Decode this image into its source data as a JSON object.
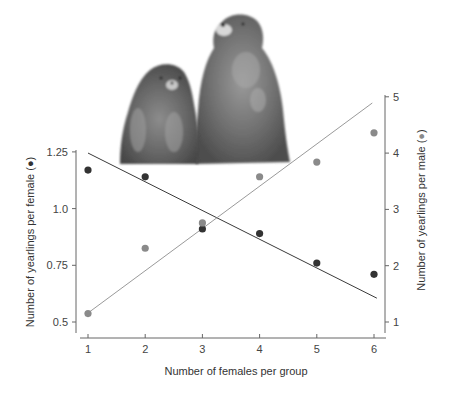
{
  "chart_data": {
    "type": "scatter",
    "title": "",
    "xlabel": "Number of females per group",
    "ylabel": "Number of yearlings per female (●)",
    "ylabel_right": "Number of yearlings per male (●)",
    "x": [
      1,
      2,
      3,
      4,
      5,
      6
    ],
    "x_ticks": [
      "1",
      "2",
      "3",
      "4",
      "5",
      "6"
    ],
    "y_ticks_left": [
      "0.5",
      "0.75",
      "1.0",
      "1.25"
    ],
    "y_ticks_right": [
      "1",
      "2",
      "3",
      "4",
      "5"
    ],
    "ylim_left": [
      0.5,
      1.25
    ],
    "ylim_right": [
      1,
      5
    ],
    "grid": false,
    "legend": "none (series identified by marker color in axis labels)",
    "series": [
      {
        "name": "Yearlings per female",
        "axis": "left",
        "color": "#333333",
        "values": [
          1.17,
          1.14,
          0.91,
          0.89,
          0.76,
          0.71
        ],
        "trendline": {
          "x": [
            1,
            6.05
          ],
          "y": [
            1.245,
            0.605
          ]
        }
      },
      {
        "name": "Yearlings per male",
        "axis": "right",
        "color": "#8a8a8a",
        "values": [
          1.15,
          2.31,
          2.76,
          3.58,
          3.84,
          4.36
        ],
        "trendline": {
          "x": [
            1,
            5.97
          ],
          "y": [
            1.16,
            4.89
          ]
        }
      }
    ],
    "illustration": "two marmots (one sitting, one standing) above the plot"
  },
  "colors": {
    "axis": "#666666",
    "female_series": "#333333",
    "male_series": "#8a8a8a",
    "female_line": "#3a3a3a",
    "male_line": "#9a9a9a"
  }
}
